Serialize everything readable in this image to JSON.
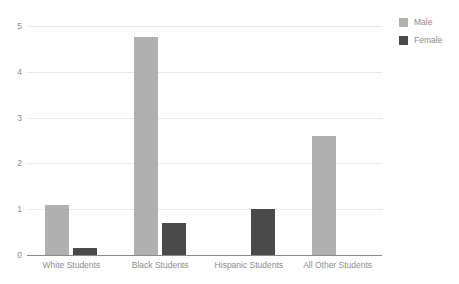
{
  "chart_data": {
    "type": "bar",
    "title": "",
    "subtitle": "",
    "xlabel": "",
    "ylabel": "",
    "categories": [
      "White Students",
      "Black Students",
      "Hispanic Students",
      "All Other Students"
    ],
    "series": [
      {
        "name": "Male",
        "color": "#b0b0b0",
        "values": [
          1.1,
          4.75,
          0,
          2.6
        ]
      },
      {
        "name": "Female",
        "color": "#4a4a4a",
        "values": [
          0.15,
          0.7,
          1.0,
          0
        ]
      }
    ],
    "ylim": [
      0,
      5
    ],
    "yticks": [
      0,
      1,
      2,
      3,
      4,
      5
    ],
    "ytick_labels": [
      "0",
      "1",
      "2",
      "3",
      "4",
      "5"
    ],
    "grid": true,
    "grid_axis": "y",
    "legend_position": "top-right",
    "legend_orientation": "vertical",
    "background": "#ffffff",
    "gridline_color": "#e9e9e9",
    "axis_color": "#8a8a8a",
    "text_color": "#8c8c8c"
  }
}
